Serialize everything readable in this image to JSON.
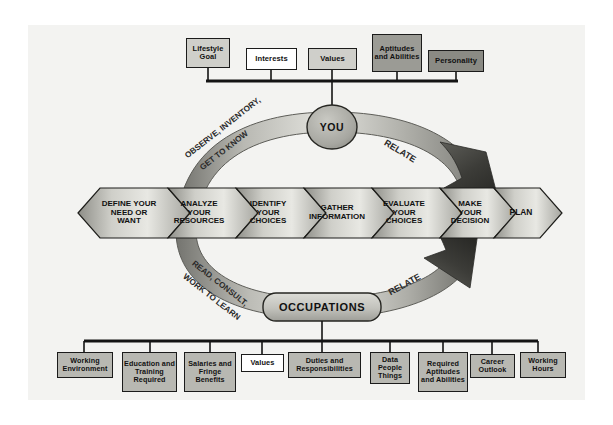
{
  "diagram": {
    "colors": {
      "panel_bg": "#f3f3f1",
      "outline": "#1b1b1b",
      "box_white": "#ffffff",
      "box_light_gray": "#cfcfca",
      "box_mid_gray": "#b8b8b2",
      "box_dark_gray": "#9b9b95",
      "box_darkest_gray": "#8a8a84",
      "arrow_light": "#d6d6d1",
      "arrow_dark": "#4a4a46"
    }
  },
  "top_factors": {
    "label": "self factors",
    "items": [
      {
        "text": "Lifestyle\nGoal",
        "lines": [
          "Lifestyle",
          "Goal"
        ],
        "shade": "nb-lgray"
      },
      {
        "text": "Interests",
        "lines": [
          "Interests"
        ],
        "shade": "nb-white"
      },
      {
        "text": "Values",
        "lines": [
          "Values"
        ],
        "shade": "nb-lgray"
      },
      {
        "text": "Aptitudes and Abilities",
        "lines": [
          "Aptitudes",
          "and",
          "Abilities"
        ],
        "shade": "nb-dgray"
      },
      {
        "text": "Personality",
        "lines": [
          "Personality"
        ],
        "shade": "nb-xgray"
      }
    ]
  },
  "center_nodes": {
    "you": "YOU",
    "occupations": "OCCUPATIONS"
  },
  "arc_labels": {
    "top_left_line1": "OBSERVE, INVENTORY,",
    "top_left_line2": "GET TO KNOW",
    "top_right": "RELATE",
    "bottom_left_line1": "READ, CONSULT,",
    "bottom_left_line2": "WORK TO LEARN",
    "bottom_right": "RELATE"
  },
  "process_steps": [
    {
      "lines": [
        "DEFINE YOUR",
        "NEED OR",
        "WANT"
      ]
    },
    {
      "lines": [
        "ANALYZE",
        "YOUR",
        "RESOURCES"
      ]
    },
    {
      "lines": [
        "IDENTIFY",
        "YOUR",
        "CHOICES"
      ]
    },
    {
      "lines": [
        "GATHER",
        "INFORMATION"
      ]
    },
    {
      "lines": [
        "EVALUATE",
        "YOUR",
        "CHOICES"
      ]
    },
    {
      "lines": [
        "MAKE",
        "YOUR",
        "DECISION"
      ]
    },
    {
      "lines": [
        "PLAN"
      ]
    }
  ],
  "bottom_factors": {
    "label": "occupation factors",
    "items": [
      {
        "text": "Working Environment",
        "lines": [
          "Working",
          "Environment"
        ],
        "shade": "nb-mgray"
      },
      {
        "text": "Education and Training Required",
        "lines": [
          "Education",
          "and",
          "Training",
          "Required"
        ],
        "shade": "nb-mgray"
      },
      {
        "text": "Salaries and Fringe Benefits",
        "lines": [
          "Salaries",
          "and",
          "Fringe",
          "Benefits"
        ],
        "shade": "nb-mgray"
      },
      {
        "text": "Values",
        "lines": [
          "Values"
        ],
        "shade": "nb-white"
      },
      {
        "text": "Duties and Responsibilities",
        "lines": [
          "Duties and",
          "Responsibilities"
        ],
        "shade": "nb-mgray"
      },
      {
        "text": "Data People Things",
        "lines": [
          "Data",
          "People",
          "Things"
        ],
        "shade": "nb-mgray"
      },
      {
        "text": "Required Aptitudes and Abilities",
        "lines": [
          "Required",
          "Aptitudes",
          "and",
          "Abilities"
        ],
        "shade": "nb-mgray"
      },
      {
        "text": "Career Outlook",
        "lines": [
          "Career",
          "Outlook"
        ],
        "shade": "nb-mgray"
      },
      {
        "text": "Working Hours",
        "lines": [
          "Working",
          "Hours"
        ],
        "shade": "nb-mgray"
      }
    ]
  }
}
